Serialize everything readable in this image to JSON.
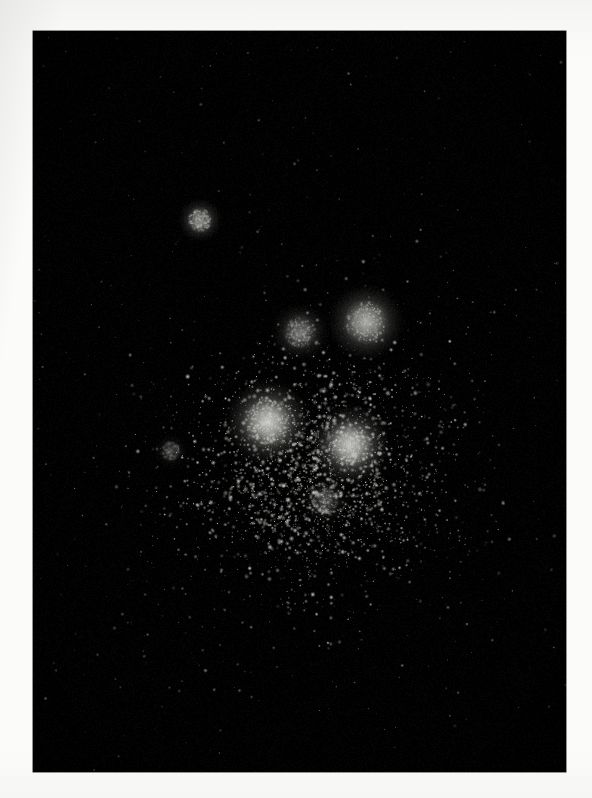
{
  "page": {
    "background_color": "#fbfbf9",
    "width": 592,
    "height": 798,
    "caption": ""
  },
  "plate": {
    "name": "astronomical-photographic-plate",
    "background_color": "#000000",
    "x": 33,
    "y": 31,
    "width": 533,
    "height": 741,
    "border_color": "#2a2a2a",
    "subject": "star cluster",
    "label": ""
  },
  "chart_data": {
    "type": "scatter",
    "title": "",
    "subtitle": "",
    "xlabel": "",
    "ylabel": "",
    "xlim": [
      0,
      533
    ],
    "ylim": [
      0,
      741
    ],
    "grid": false,
    "legend": "none",
    "background": "#000000",
    "point_color": "#cfcfcb",
    "field_center": {
      "x": 277,
      "y": 419
    },
    "field_radius": 230,
    "bright_knots": [
      {
        "id": "knot-core-left",
        "x": 235,
        "y": 391,
        "radius": 19,
        "peak_brightness": 0.95,
        "label": "brightest core knot"
      },
      {
        "id": "knot-core-right",
        "x": 317,
        "y": 414,
        "radius": 18,
        "peak_brightness": 0.93,
        "label": "second core knot"
      },
      {
        "id": "knot-upper-right",
        "x": 333,
        "y": 291,
        "radius": 17,
        "peak_brightness": 0.8,
        "label": "upper right knot"
      },
      {
        "id": "knot-upper-mid",
        "x": 267,
        "y": 301,
        "radius": 13,
        "peak_brightness": 0.52,
        "label": "diffuse upper knot"
      },
      {
        "id": "knot-outlying-upper-left",
        "x": 167,
        "y": 189,
        "radius": 10,
        "peak_brightness": 0.62,
        "label": "isolated outlying clump"
      },
      {
        "id": "knot-lower-halo",
        "x": 292,
        "y": 470,
        "radius": 11,
        "peak_brightness": 0.3,
        "label": "lower halo condensation"
      },
      {
        "id": "knot-left-faint",
        "x": 138,
        "y": 420,
        "radius": 8,
        "peak_brightness": 0.22,
        "label": "faint left condensation"
      }
    ],
    "density_profile": {
      "core_points": 1500,
      "halo_points": 900,
      "field_points": 420,
      "note": "counts are approximate rendered source counts"
    }
  },
  "controls": {
    "interactable": false,
    "note": "static photographic reproduction; no UI controls present"
  }
}
